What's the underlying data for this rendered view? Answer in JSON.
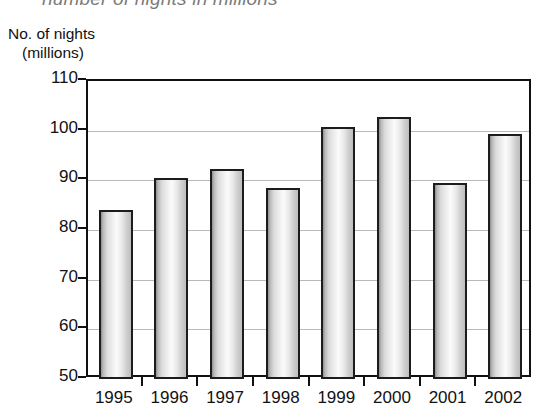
{
  "caption": {
    "text": "number of nights in millions"
  },
  "axis_title": {
    "line1": "No. of nights",
    "line2": "(millions)"
  },
  "chart_data": {
    "type": "bar",
    "title": "number of nights in millions",
    "xlabel": "",
    "ylabel": "No. of nights (millions)",
    "categories": [
      "1995",
      "1996",
      "1997",
      "1998",
      "1999",
      "2000",
      "2001",
      "2002"
    ],
    "values": [
      84.0,
      90.5,
      92.3,
      88.5,
      100.7,
      102.7,
      89.5,
      99.4
    ],
    "ylim": [
      50,
      110
    ],
    "yticks": [
      50,
      60,
      70,
      80,
      90,
      100,
      110
    ],
    "ytick_labels": [
      "50",
      "60",
      "70",
      "80",
      "90",
      "100",
      "110"
    ],
    "grid": true,
    "legend": "none",
    "colors": {
      "bar_fill_light": "#fbfbfb",
      "bar_fill_mid": "#d4d4d4",
      "bar_fill_dark": "#8e8e8e",
      "bar_border": "#1c1c1c",
      "axis": "#111111",
      "gridline": "#b9b9b9",
      "caption": "#7b7b7b",
      "background": "#ffffff"
    }
  }
}
